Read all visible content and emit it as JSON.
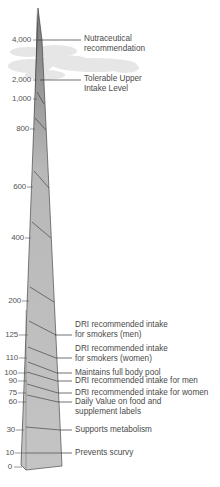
{
  "ticks": [
    {
      "value": "4,000",
      "y": 40
    },
    {
      "value": "2,000",
      "y": 80
    },
    {
      "value": "1,000",
      "y": 99
    },
    {
      "value": "800",
      "y": 129
    },
    {
      "value": "600",
      "y": 187
    },
    {
      "value": "400",
      "y": 238
    },
    {
      "value": "200",
      "y": 301
    },
    {
      "value": "125",
      "y": 335
    },
    {
      "value": "110",
      "y": 358
    },
    {
      "value": "100",
      "y": 373
    },
    {
      "value": "90",
      "y": 381
    },
    {
      "value": "75",
      "y": 393
    },
    {
      "value": "60",
      "y": 402
    },
    {
      "value": "30",
      "y": 430
    },
    {
      "value": "10",
      "y": 453
    },
    {
      "value": "0",
      "y": 467
    }
  ],
  "annotations": [
    {
      "line1": "Nutraceutical",
      "line2": "recommendation",
      "value": "4,000"
    },
    {
      "line1": "Tolerable Upper",
      "line2": "Intake Level",
      "value": "2,000"
    },
    {
      "line1": "DRI recommended intake",
      "line2": "for smokers (men)",
      "value": "125"
    },
    {
      "line1": "DRI recommended intake",
      "line2": "for smokers (women)",
      "value": "110"
    },
    {
      "line1": "Maintains full body pool",
      "line2": "",
      "value": "100"
    },
    {
      "line1": "DRI recommended intake for men",
      "line2": "",
      "value": "90"
    },
    {
      "line1": "DRI recommended intake for women",
      "line2": "",
      "value": "75"
    },
    {
      "line1": "Daily Value on food and",
      "line2": "supplement labels",
      "value": "60"
    },
    {
      "line1": "Supports metabolism",
      "line2": "",
      "value": "30"
    },
    {
      "line1": "Prevents scurvy",
      "line2": "",
      "value": "10"
    }
  ],
  "colors": {
    "spire_front": "#bdbdbd",
    "spire_side": "#8e8e8e",
    "cloud": "#e6e6e6",
    "line": "#333333"
  }
}
